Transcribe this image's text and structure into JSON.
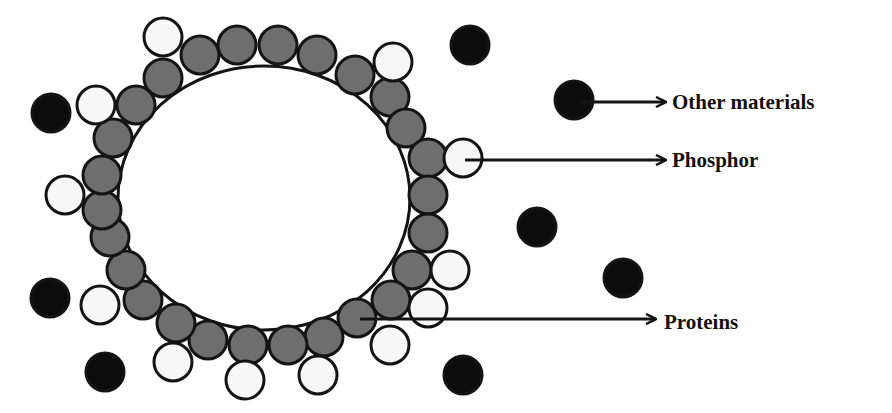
{
  "colors": {
    "protein": "#6e6e6e",
    "phosphor": "#f7f7f7",
    "other": "#0c0c0c",
    "stroke": "#141414",
    "core": "#ffffff"
  },
  "core": {
    "cx": 264,
    "cy": 198,
    "rx": 146,
    "ry": 132
  },
  "particle_radius": 19,
  "labels": {
    "other_materials": "Other materials",
    "phosphor": "Phosphor",
    "proteins": "Proteins"
  },
  "proteins": [
    [
      163,
      78
    ],
    [
      200,
      55
    ],
    [
      237,
      45
    ],
    [
      278,
      45
    ],
    [
      317,
      55
    ],
    [
      355,
      75
    ],
    [
      390,
      97
    ],
    [
      406,
      128
    ],
    [
      428,
      158
    ],
    [
      428,
      195
    ],
    [
      428,
      233
    ],
    [
      412,
      270
    ],
    [
      391,
      300
    ],
    [
      357,
      318
    ],
    [
      324,
      337
    ],
    [
      288,
      345
    ],
    [
      248,
      345
    ],
    [
      208,
      340
    ],
    [
      176,
      323
    ],
    [
      143,
      300
    ],
    [
      126,
      270
    ],
    [
      110,
      237
    ],
    [
      102,
      210
    ],
    [
      102,
      175
    ],
    [
      113,
      138
    ],
    [
      136,
      105
    ]
  ],
  "phosphors": [
    [
      163,
      37
    ],
    [
      393,
      62
    ],
    [
      96,
      105
    ],
    [
      65,
      195
    ],
    [
      463,
      158
    ],
    [
      450,
      270
    ],
    [
      428,
      308
    ],
    [
      390,
      345
    ],
    [
      318,
      375
    ],
    [
      245,
      380
    ],
    [
      173,
      362
    ],
    [
      100,
      305
    ]
  ],
  "others": [
    [
      51,
      113
    ],
    [
      470,
      45
    ],
    [
      574,
      100
    ],
    [
      537,
      227
    ],
    [
      623,
      278
    ],
    [
      50,
      298
    ],
    [
      105,
      372
    ],
    [
      463,
      375
    ]
  ],
  "arrows": [
    {
      "name": "other-materials-arrow",
      "x1": 580,
      "y1": 102,
      "x2": 665,
      "y2": 102
    },
    {
      "name": "phosphor-arrow",
      "x1": 465,
      "y1": 160,
      "x2": 665,
      "y2": 160
    },
    {
      "name": "proteins-arrow",
      "x1": 360,
      "y1": 319,
      "x2": 655,
      "y2": 319
    }
  ]
}
